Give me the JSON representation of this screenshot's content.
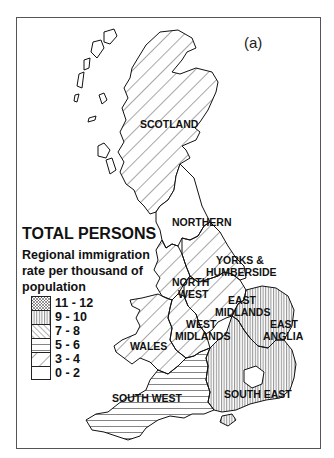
{
  "figure": {
    "panel_letter": "(a)",
    "cut_caption": ""
  },
  "legend": {
    "title": "TOTAL PERSONS",
    "subtitle_lines": [
      "Regional immigration",
      "rate per thousand of",
      "population"
    ],
    "classes": [
      {
        "label": "11 - 12",
        "pattern": "crosshatch"
      },
      {
        "label": "9 - 10",
        "pattern": "vertical-lines"
      },
      {
        "label": "7 - 8",
        "pattern": "dense-diagonal"
      },
      {
        "label": "5 - 6",
        "pattern": "horizontal-lines"
      },
      {
        "label": "3 - 4",
        "pattern": "wide-diagonal"
      },
      {
        "label": "0 - 2",
        "pattern": "blank"
      }
    ]
  },
  "regions": [
    {
      "name": "SCOTLAND",
      "class": "3 - 4"
    },
    {
      "name": "NORTHERN",
      "class": "0 - 2"
    },
    {
      "name": "YORKS & HUMBERSIDE",
      "class": "3 - 4"
    },
    {
      "name": "NORTH WEST",
      "class": "3 - 4"
    },
    {
      "name": "EAST MIDLANDS",
      "class": "3 - 4"
    },
    {
      "name": "WEST MIDLANDS",
      "class": "3 - 4"
    },
    {
      "name": "WALES",
      "class": "3 - 4"
    },
    {
      "name": "EAST ANGLIA",
      "class": "9 - 10"
    },
    {
      "name": "SOUTH EAST",
      "class": "9 - 10"
    },
    {
      "name": "SOUTH WEST",
      "class": "5 - 6"
    }
  ],
  "labels": {
    "scotland": "SCOTLAND",
    "northern": "NORTHERN",
    "yorks_1": "YORKS &",
    "yorks_2": "HUMBERSIDE",
    "northwest_1": "NORTH",
    "northwest_2": "WEST",
    "eastmid_1": "EAST",
    "eastmid_2": "MIDLANDS",
    "westmid_1": "WEST",
    "westmid_2": "MIDLANDS",
    "wales": "WALES",
    "eastanglia_1": "EAST",
    "eastanglia_2": "ANGLIA",
    "southeast": "SOUTH EAST",
    "southwest": "SOUTH WEST"
  }
}
